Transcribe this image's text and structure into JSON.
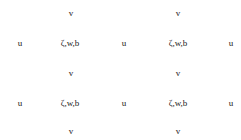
{
  "diagram": {
    "rows": [
      {
        "type": "v",
        "y": 13,
        "items": [
          {
            "label": "v",
            "x": 71
          },
          {
            "label": "v",
            "x": 178
          }
        ]
      },
      {
        "type": "uz",
        "y": 43,
        "items": [
          {
            "label": "u",
            "x": 20
          },
          {
            "label": "ζ,w,b",
            "x": 70
          },
          {
            "label": "u",
            "x": 124
          },
          {
            "label": "ζ,w,b",
            "x": 178
          },
          {
            "label": "u",
            "x": 231
          }
        ]
      },
      {
        "type": "v",
        "y": 73,
        "items": [
          {
            "label": "v",
            "x": 71
          },
          {
            "label": "v",
            "x": 178
          }
        ]
      },
      {
        "type": "uz",
        "y": 103,
        "items": [
          {
            "label": "u",
            "x": 20
          },
          {
            "label": "ζ,w,b",
            "x": 70
          },
          {
            "label": "u",
            "x": 124
          },
          {
            "label": "ζ,w,b",
            "x": 178
          },
          {
            "label": "u",
            "x": 231
          }
        ]
      },
      {
        "type": "v",
        "y": 131,
        "items": [
          {
            "label": "v",
            "x": 71
          },
          {
            "label": "v",
            "x": 178
          }
        ]
      }
    ]
  }
}
